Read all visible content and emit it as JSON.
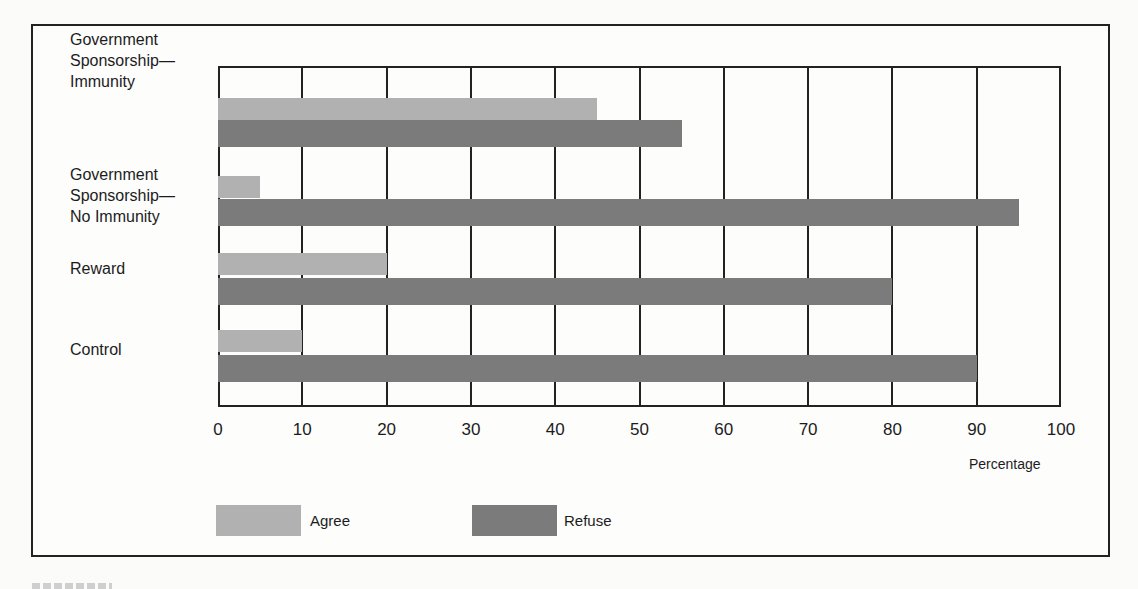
{
  "chart_data": {
    "type": "bar",
    "orientation": "horizontal",
    "title": "",
    "categories": [
      "Government Sponsorship—Immunity",
      "Government Sponsorship—No Immunity",
      "Reward",
      "Control"
    ],
    "series": [
      {
        "name": "Agree",
        "values": [
          45,
          5,
          20,
          10
        ],
        "color": "#b1b1b1"
      },
      {
        "name": "Refuse",
        "values": [
          55,
          95,
          80,
          90
        ],
        "color": "#7b7b7b"
      }
    ],
    "xlabel": "Percentage",
    "ylabel": "",
    "xlim": [
      0,
      100
    ],
    "xticks": [
      0,
      10,
      20,
      30,
      40,
      50,
      60,
      70,
      80,
      90,
      100
    ],
    "grid": true,
    "legend_position": "bottom"
  },
  "labels": {
    "cat0": "Government\nSponsorship—\nImmunity",
    "cat1": "Government\nSponsorship—\nNo Immunity",
    "cat2": "Reward",
    "cat3": "Control"
  },
  "ticks": [
    "0",
    "10",
    "20",
    "30",
    "40",
    "50",
    "60",
    "70",
    "80",
    "90",
    "100"
  ],
  "xlabel": "Percentage",
  "legend": {
    "agree": "Agree",
    "refuse": "Refuse"
  }
}
